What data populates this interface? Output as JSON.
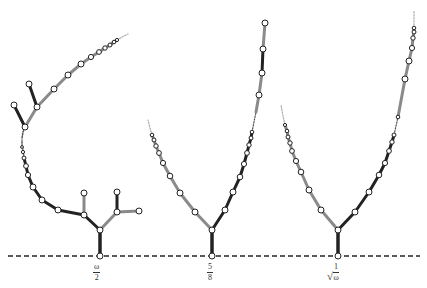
{
  "diagram": {
    "title": "",
    "baseline": {
      "style": "dashed",
      "y": 256,
      "color": "#222222"
    },
    "colors": {
      "dark_edge": "#222222",
      "light_edge": "#8a8a8a",
      "node_fill": "#ffffff",
      "node_stroke": "#222222"
    },
    "trees": [
      {
        "id": "tree-1",
        "root_x": 100,
        "label": {
          "type": "fraction",
          "numerator": "ω",
          "denominator": "2"
        }
      },
      {
        "id": "tree-2",
        "root_x": 212,
        "label": {
          "type": "fraction",
          "numerator": "5",
          "denominator": "8"
        }
      },
      {
        "id": "tree-3",
        "root_x": 338,
        "label": {
          "type": "sqrt-fraction",
          "numerator": "1",
          "denominator": "ω"
        }
      }
    ]
  }
}
